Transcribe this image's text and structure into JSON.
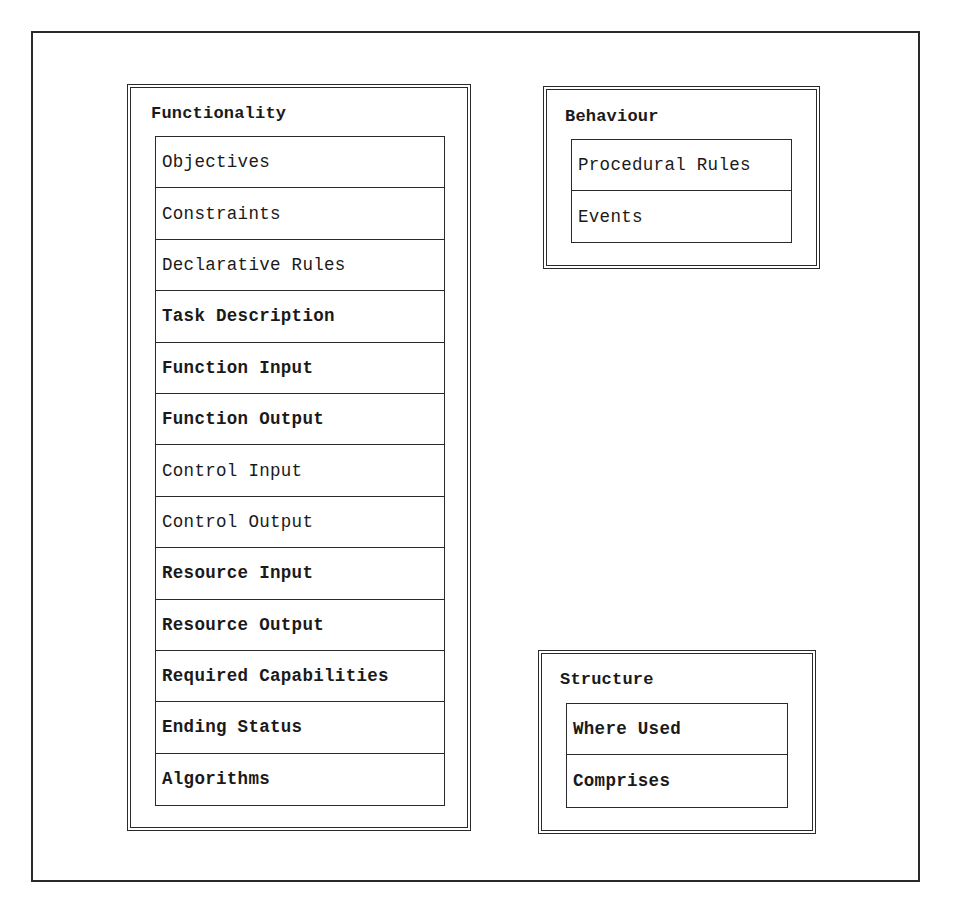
{
  "diagram": {
    "groups": [
      {
        "id": "functionality",
        "title": "Functionality",
        "items": [
          {
            "label": "Objectives"
          },
          {
            "label": "Constraints"
          },
          {
            "label": "Declarative Rules"
          },
          {
            "label": "Task Description"
          },
          {
            "label": "Function Input"
          },
          {
            "label": "Function Output"
          },
          {
            "label": "Control Input"
          },
          {
            "label": "Control Output"
          },
          {
            "label": "Resource Input"
          },
          {
            "label": "Resource Output"
          },
          {
            "label": "Required Capabilities"
          },
          {
            "label": "Ending Status"
          },
          {
            "label": "Algorithms"
          }
        ]
      },
      {
        "id": "behaviour",
        "title": "Behaviour",
        "items": [
          {
            "label": "Procedural Rules"
          },
          {
            "label": "Events"
          }
        ]
      },
      {
        "id": "structure",
        "title": "Structure",
        "items": [
          {
            "label": "Where Used"
          },
          {
            "label": "Comprises"
          }
        ]
      }
    ]
  },
  "colors": {
    "line": "#2a2a2a",
    "text": "#1a1a1a",
    "background": "#ffffff"
  }
}
